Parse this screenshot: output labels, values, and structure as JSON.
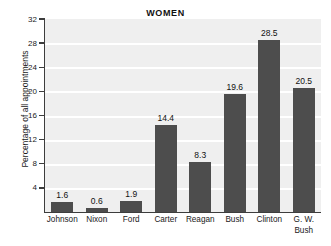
{
  "chart_data": {
    "type": "bar",
    "title": "WOMEN",
    "xlabel": "",
    "ylabel": "Percentage of all appointments",
    "categories": [
      "Johnson",
      "Nixon",
      "Ford",
      "Carter",
      "Reagan",
      "Bush",
      "Clinton",
      "G. W.\nBush"
    ],
    "values": [
      1.6,
      0.6,
      1.9,
      14.4,
      8.3,
      19.6,
      28.5,
      20.5
    ],
    "value_labels": [
      "1.6",
      "0.6",
      "1.9",
      "14.4",
      "8.3",
      "19.6",
      "28.5",
      "20.5"
    ],
    "ylim": [
      0,
      32
    ],
    "yticks": [
      4,
      8,
      12,
      16,
      20,
      24,
      28,
      32
    ],
    "ytick_labels": [
      "4",
      "8",
      "12",
      "16",
      "20",
      "24",
      "28",
      "32"
    ],
    "grid": "horizontal-white-lines",
    "legend": null,
    "bar_color": "#4d4d4d",
    "plot_background": "#efefef",
    "page_background": "#ffffff",
    "axis_color": "#3d3d3d"
  }
}
